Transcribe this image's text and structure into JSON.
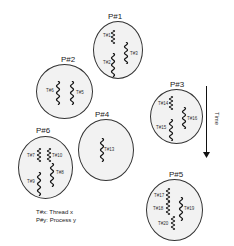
{
  "processes": [
    {
      "id": "p1",
      "label": "P#1",
      "threads": [
        {
          "label": "T#1"
        },
        {
          "label": "T#3"
        },
        {
          "label": "T#2"
        }
      ]
    },
    {
      "id": "p2",
      "label": "P#2",
      "threads": [
        {
          "label": "T#6"
        },
        {
          "label": "T#5"
        }
      ]
    },
    {
      "id": "p3",
      "label": "P#3",
      "threads": [
        {
          "label": "T#14"
        },
        {
          "label": "T#16"
        },
        {
          "label": "T#15"
        }
      ]
    },
    {
      "id": "p4",
      "label": "P#4",
      "threads": [
        {
          "label": "T#13"
        }
      ]
    },
    {
      "id": "p6",
      "label": "P#6",
      "threads": [
        {
          "label": "T#7"
        },
        {
          "label": "T#10"
        },
        {
          "label": "T#8"
        },
        {
          "label": "T#9"
        }
      ]
    },
    {
      "id": "p5",
      "label": "P#5",
      "threads": [
        {
          "label": "T#17"
        },
        {
          "label": "T#18"
        },
        {
          "label": "T#19"
        },
        {
          "label": "T#20"
        }
      ]
    }
  ],
  "time_axis": {
    "label": "Time",
    "direction": "down"
  },
  "legend": {
    "line1": "T#x: Thread x",
    "line2": "P#y: Process y"
  },
  "icons": {
    "thread": "wavy-line-icon",
    "time": "down-arrow-icon"
  }
}
